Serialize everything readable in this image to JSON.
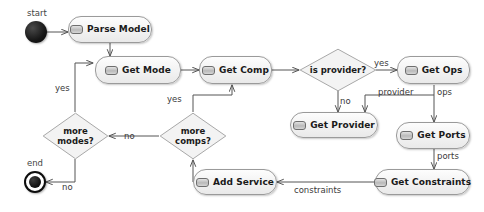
{
  "diagram": {
    "type": "uml-activity-diagram",
    "width": 484,
    "height": 212,
    "background": "#ffffff",
    "node_fill": "#f2f2f2",
    "node_border": "#9a9a9a",
    "edge_color": "#555555",
    "text_color": "#1a1a1a"
  },
  "nodes": {
    "start": {
      "label": "start",
      "kind": "initial"
    },
    "end": {
      "label": "end",
      "kind": "final"
    },
    "parse_model": {
      "label": "Parse Model",
      "kind": "activity"
    },
    "get_mode": {
      "label": "Get Mode",
      "kind": "activity"
    },
    "get_comp": {
      "label": "Get Comp",
      "kind": "activity"
    },
    "get_ops": {
      "label": "Get Ops",
      "kind": "activity"
    },
    "get_provider": {
      "label": "Get Provider",
      "kind": "activity"
    },
    "get_ports": {
      "label": "Get Ports",
      "kind": "activity"
    },
    "get_constraints": {
      "label": "Get Constraints",
      "kind": "activity"
    },
    "add_service": {
      "label": "Add Service",
      "kind": "activity"
    },
    "is_provider": {
      "label_line1": "is provider?",
      "label_line2": "",
      "kind": "decision"
    },
    "more_modes": {
      "label_line1": "more",
      "label_line2": "modes?",
      "kind": "decision"
    },
    "more_comps": {
      "label_line1": "more",
      "label_line2": "comps?",
      "kind": "decision"
    }
  },
  "edge_labels": {
    "is_provider_yes": "yes",
    "is_provider_no": "no",
    "provider": "provider",
    "ops": "ops",
    "ports": "ports",
    "constraints": "constraints",
    "more_comps_no": "no",
    "more_comps_yes": "yes",
    "more_modes_no": "no",
    "more_modes_yes": "yes"
  }
}
